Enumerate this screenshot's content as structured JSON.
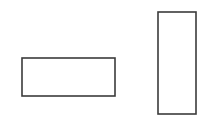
{
  "canvas": {
    "width": 219,
    "height": 136,
    "background_color": "#ffffff",
    "title": "Two outlined rectangles on white background"
  },
  "chart_data": {
    "type": "diagram",
    "title": "",
    "subtitle": "",
    "xlabel": "",
    "ylabel": "",
    "grid": false,
    "legend": null,
    "annotations": [],
    "units": "pixels",
    "coordinate_origin": "top-left",
    "xlim": [
      0,
      219
    ],
    "ylim": [
      0,
      136
    ],
    "shapes": [
      {
        "id": "rect-landscape",
        "label": "",
        "kind": "rectangle",
        "orientation": "horizontal",
        "x": 22,
        "y": 58,
        "width": 93,
        "height": 38,
        "aspect_ratio": "2.45",
        "stroke_color": "#3b3b3b",
        "stroke_width": 1.6,
        "fill_color": "#ffffff"
      },
      {
        "id": "rect-portrait",
        "label": "",
        "kind": "rectangle",
        "orientation": "vertical",
        "x": 158,
        "y": 12,
        "width": 38,
        "height": 102,
        "aspect_ratio": "0.37",
        "stroke_color": "#3b3b3b",
        "stroke_width": 1.6,
        "fill_color": "#ffffff"
      }
    ]
  }
}
